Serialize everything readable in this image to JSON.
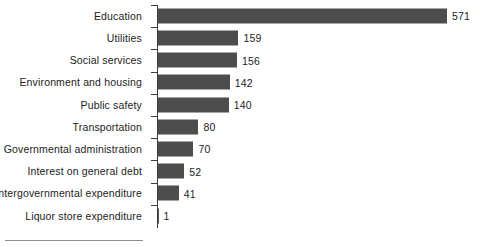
{
  "chart_data": {
    "type": "bar",
    "orientation": "horizontal",
    "title": "",
    "subtitle": "",
    "xlabel": "",
    "ylabel": "",
    "xlim": [
      0,
      571
    ],
    "grid": false,
    "legend": null,
    "value_labels_shown": true,
    "axis_tick_labels": [],
    "categories": [
      "Education",
      "Utilities",
      "Social services",
      "Environment and housing",
      "Public safety",
      "Transportation",
      "Governmental administration",
      "Interest on general debt",
      "Intergovernmental expenditure",
      "Liquor store expenditure"
    ],
    "values": [
      571,
      159,
      156,
      142,
      140,
      80,
      70,
      52,
      41,
      1
    ],
    "value_label_texts": [
      "571",
      "159",
      "156",
      "142",
      "140",
      "80",
      "70",
      "52",
      "41",
      "1"
    ],
    "bars": [
      {
        "category": "Education",
        "value": 571,
        "label": "571"
      },
      {
        "category": "Utilities",
        "value": 159,
        "label": "159"
      },
      {
        "category": "Social services",
        "value": 156,
        "label": "156"
      },
      {
        "category": "Environment and housing",
        "value": 142,
        "label": "142"
      },
      {
        "category": "Public safety",
        "value": 140,
        "label": "140"
      },
      {
        "category": "Transportation",
        "value": 80,
        "label": "80"
      },
      {
        "category": "Governmental administration",
        "value": 70,
        "label": "70"
      },
      {
        "category": "Interest on general debt",
        "value": 52,
        "label": "52"
      },
      {
        "category": "Intergovernmental expenditure",
        "value": 41,
        "label": "41"
      },
      {
        "category": "Liquor store expenditure",
        "value": 1,
        "label": "1"
      }
    ]
  },
  "style": {
    "bar_color": "#4d4d4d",
    "axis_color": "#3d3d3d",
    "text_color": "#1c1c1c",
    "background_color": "#ffffff",
    "rule_color": "#8d8d8d"
  }
}
